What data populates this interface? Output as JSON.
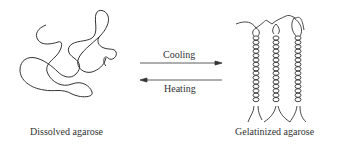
{
  "diagram": {
    "left_state": {
      "caption": "Dissolved agarose",
      "icon": "random-coil-tangle"
    },
    "right_state": {
      "caption": "Gelatinized agarose",
      "icon": "double-helix-chains"
    },
    "forward_arrow": {
      "label": "Cooling",
      "direction": "right"
    },
    "reverse_arrow": {
      "label": "Heating",
      "direction": "left"
    },
    "colors": {
      "stroke": "#333333",
      "background": "#ffffff"
    }
  }
}
